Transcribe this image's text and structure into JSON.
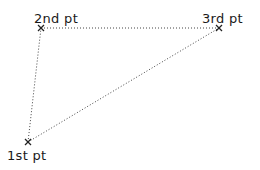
{
  "diagram": {
    "points": [
      {
        "id": "p1",
        "label": "1st pt",
        "x": 28,
        "y": 142
      },
      {
        "id": "p2",
        "label": "2nd pt",
        "x": 41,
        "y": 28
      },
      {
        "id": "p3",
        "label": "3rd pt",
        "x": 219,
        "y": 28
      }
    ],
    "edges": [
      {
        "from": "p1",
        "to": "p2",
        "style": "dotted"
      },
      {
        "from": "p2",
        "to": "p3",
        "style": "dotted"
      },
      {
        "from": "p1",
        "to": "p3",
        "style": "dotted"
      }
    ],
    "line_color": "#444444",
    "marker": "x-mark"
  }
}
